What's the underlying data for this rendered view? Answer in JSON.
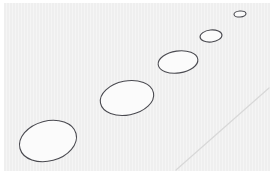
{
  "figure": {
    "width": 273,
    "height": 174,
    "background_color": "#ffffff",
    "plot_area": {
      "x": 4,
      "y": 3,
      "width": 266,
      "height": 168,
      "fill_color": "#efefef",
      "stripe_color": "#f4f4f4",
      "stripe_period": 3
    }
  },
  "chart_data": {
    "type": "scatter",
    "xlabel": "",
    "ylabel": "",
    "xlim": [
      0,
      273
    ],
    "ylim": [
      0,
      174
    ],
    "grid": false,
    "legend": null,
    "annotations": [],
    "series": [
      {
        "name": "ellipses",
        "marker": "ellipse",
        "stroke_color": "#4a4a50",
        "fill_color": "#fbfbfb",
        "stroke_width": 1.1,
        "points": [
          {
            "id": "ellipse-1",
            "cx": 48,
            "cy": 141,
            "rx": 29,
            "ry": 20,
            "rotation": -15
          },
          {
            "id": "ellipse-2",
            "cx": 127,
            "cy": 98,
            "rx": 27,
            "ry": 17,
            "rotation": -11
          },
          {
            "id": "ellipse-3",
            "cx": 178,
            "cy": 62,
            "rx": 20,
            "ry": 11,
            "rotation": -8
          },
          {
            "id": "ellipse-4",
            "cx": 211,
            "cy": 36,
            "rx": 11,
            "ry": 6,
            "rotation": -6
          },
          {
            "id": "ellipse-5",
            "cx": 240,
            "cy": 14,
            "rx": 6,
            "ry": 3,
            "rotation": -5
          }
        ]
      },
      {
        "name": "ground-line",
        "marker": "line",
        "stroke_color": "#d8d8d8",
        "stroke_width": 1.2,
        "points": [
          {
            "id": "line-start",
            "x": 176,
            "y": 170
          },
          {
            "id": "line-end",
            "x": 269,
            "y": 88
          }
        ]
      }
    ]
  }
}
